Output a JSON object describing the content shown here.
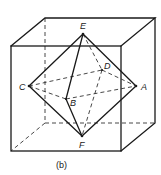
{
  "figure": {
    "caption": "(b)",
    "vertices": {
      "E": "E",
      "D": "D",
      "C": "C",
      "A": "A",
      "B": "B",
      "F": "F"
    }
  }
}
